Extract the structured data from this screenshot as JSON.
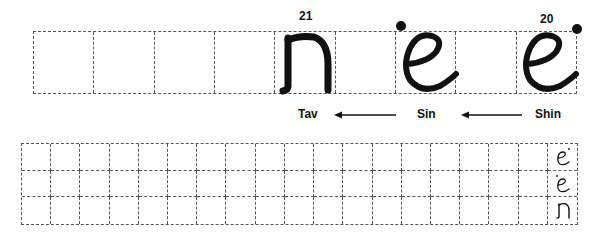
{
  "top_row": {
    "cells": 9,
    "letters": [
      {
        "name": "Tav",
        "number": "21",
        "column": 5
      },
      {
        "name": "Sin",
        "number": "",
        "column": 7
      },
      {
        "name": "Shin",
        "number": "20",
        "column": 9
      }
    ]
  },
  "labels": {
    "tav": "Tav",
    "sin": "Sin",
    "shin": "Shin"
  },
  "numbers": {
    "tav": "21",
    "shin": "20"
  },
  "practice_grid": {
    "rows": 3,
    "columns": 19,
    "row_samples": [
      "Shin",
      "Sin",
      "Tav"
    ]
  },
  "colors": {
    "ink": "#111111",
    "dashed_border": "#555555",
    "background": "#ffffff"
  }
}
